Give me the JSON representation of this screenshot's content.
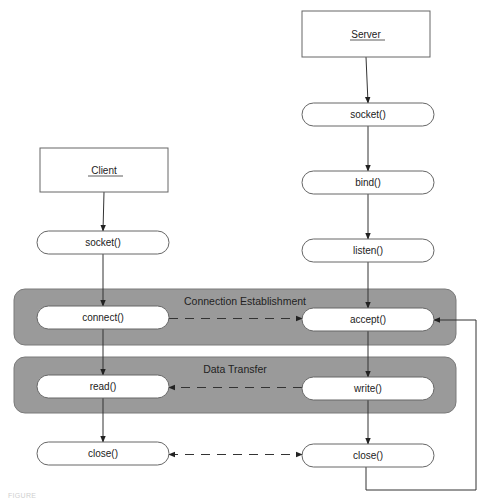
{
  "diagram": {
    "colors": {
      "band_fill": "#9a9a9a",
      "band_stroke": "#7a7a7a",
      "node_fill": "#ffffff",
      "node_stroke": "#666666",
      "line": "#333333",
      "text": "#222222"
    },
    "actors": [
      {
        "id": "client",
        "label": "Client",
        "x": 40,
        "y": 148,
        "w": 128,
        "h": 44
      },
      {
        "id": "server",
        "label": "Server",
        "x": 302,
        "y": 11,
        "w": 128,
        "h": 46
      }
    ],
    "bands": [
      {
        "id": "connection-establishment",
        "label": "Connection Establishment",
        "x": 14,
        "y": 289,
        "w": 442,
        "h": 56,
        "label_x": 245,
        "label_y": 305
      },
      {
        "id": "data-transfer",
        "label": "Data Transfer",
        "x": 14,
        "y": 357,
        "w": 442,
        "h": 56,
        "label_x": 235,
        "label_y": 373
      }
    ],
    "nodes": [
      {
        "id": "client-socket",
        "label": "socket()",
        "x": 37,
        "y": 231,
        "w": 132,
        "h": 23
      },
      {
        "id": "client-connect",
        "label": "connect()",
        "x": 37,
        "y": 306,
        "w": 132,
        "h": 23
      },
      {
        "id": "client-read",
        "label": "read()",
        "x": 37,
        "y": 375,
        "w": 132,
        "h": 23
      },
      {
        "id": "client-close",
        "label": "close()",
        "x": 37,
        "y": 442,
        "w": 132,
        "h": 23
      },
      {
        "id": "server-socket",
        "label": "socket()",
        "x": 302,
        "y": 103,
        "w": 132,
        "h": 23
      },
      {
        "id": "server-bind",
        "label": "bind()",
        "x": 302,
        "y": 171,
        "w": 132,
        "h": 23
      },
      {
        "id": "server-listen",
        "label": "listen()",
        "x": 302,
        "y": 239,
        "w": 132,
        "h": 23
      },
      {
        "id": "server-accept",
        "label": "accept()",
        "x": 302,
        "y": 308,
        "w": 132,
        "h": 23
      },
      {
        "id": "server-write",
        "label": "write()",
        "x": 302,
        "y": 377,
        "w": 132,
        "h": 23
      },
      {
        "id": "server-close",
        "label": "close()",
        "x": 302,
        "y": 444,
        "w": 132,
        "h": 23
      }
    ],
    "edges": [
      {
        "from": "client",
        "to": "client-socket",
        "style": "solid"
      },
      {
        "from": "client-socket",
        "to": "client-connect",
        "style": "solid"
      },
      {
        "from": "client-connect",
        "to": "client-read",
        "style": "solid"
      },
      {
        "from": "client-read",
        "to": "client-close",
        "style": "solid"
      },
      {
        "from": "server",
        "to": "server-socket",
        "style": "solid"
      },
      {
        "from": "server-socket",
        "to": "server-bind",
        "style": "solid"
      },
      {
        "from": "server-bind",
        "to": "server-listen",
        "style": "solid"
      },
      {
        "from": "server-listen",
        "to": "server-accept",
        "style": "solid"
      },
      {
        "from": "server-accept",
        "to": "server-write",
        "style": "solid"
      },
      {
        "from": "server-write",
        "to": "server-close",
        "style": "solid"
      },
      {
        "from": "client-connect",
        "to": "server-accept",
        "style": "dashed",
        "arrows": "end"
      },
      {
        "from": "server-write",
        "to": "client-read",
        "style": "dashed",
        "arrows": "end"
      },
      {
        "from": "client-close",
        "to": "server-close",
        "style": "dashed",
        "arrows": "both"
      },
      {
        "from": "server-close",
        "to": "server-accept",
        "style": "loop",
        "points": [
          [
            366,
            467
          ],
          [
            366,
            490
          ],
          [
            476,
            490
          ],
          [
            476,
            320
          ],
          [
            434,
            320
          ]
        ]
      }
    ]
  },
  "caption": "FIGURE"
}
